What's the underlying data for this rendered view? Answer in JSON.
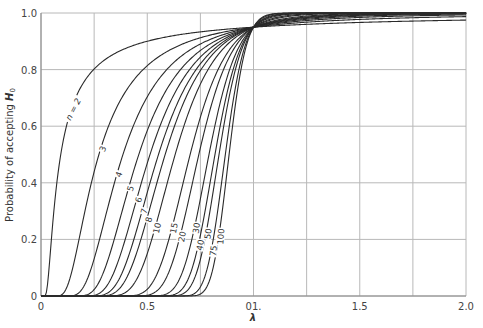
{
  "chart_data": {
    "type": "line",
    "title": "",
    "xlabel": "λ",
    "ylabel": "Probability of accepting H0",
    "xlim": [
      0,
      2.0
    ],
    "ylim": [
      0,
      1.0
    ],
    "grid": true,
    "x_tick_labels": [
      "0",
      "0.5",
      "01.",
      "1.5",
      "2.0"
    ],
    "x_ticks": [
      0,
      0.5,
      1.0,
      1.5,
      2.0
    ],
    "x_gridlines": [
      0,
      0.25,
      0.5,
      0.75,
      1.0,
      1.25,
      1.5,
      1.75,
      2.0
    ],
    "y_tick_labels": [
      "0",
      "0.2",
      "0.4",
      "0.6",
      "0.8",
      "1.0"
    ],
    "y_ticks": [
      0,
      0.2,
      0.4,
      0.6,
      0.8,
      1.0
    ],
    "crossover": {
      "x": 1.0,
      "y": 0.95
    },
    "series_note": "OC curves: P(accept) = P(chi2_{n-1} > c_n / λ^2), c_n = lower 5% chi-square point",
    "series": [
      {
        "name": "n = 2",
        "label": "n = 2",
        "df": 1,
        "c": 0.00393,
        "sample": {
          "0.1": 0.53,
          "0.25": 0.8,
          "0.5": 0.9,
          "1.0": 0.95,
          "2.0": 0.975
        }
      },
      {
        "name": "3",
        "label": "3",
        "df": 2,
        "c": 0.103,
        "sample": {
          "0.25": 0.44,
          "0.5": 0.81,
          "1.0": 0.95,
          "2.0": 0.987
        }
      },
      {
        "name": "4",
        "label": "4",
        "df": 3,
        "c": 0.352,
        "sample": {
          "0.25": 0.13,
          "0.5": 0.65,
          "1.0": 0.95,
          "2.0": 0.99
        }
      },
      {
        "name": "5",
        "label": "5",
        "df": 4,
        "c": 0.711,
        "sample": {
          "0.5": 0.54,
          "1.0": 0.95
        }
      },
      {
        "name": "6",
        "label": "6",
        "df": 5,
        "c": 1.145,
        "sample": {
          "0.5": 0.44,
          "1.0": 0.95
        }
      },
      {
        "name": "7",
        "label": "7",
        "df": 6,
        "c": 1.635,
        "sample": {
          "0.5": 0.37,
          "1.0": 0.95
        }
      },
      {
        "name": "8",
        "label": "8",
        "df": 7,
        "c": 2.167,
        "sample": {
          "0.5": 0.3,
          "1.0": 0.95
        }
      },
      {
        "name": "10",
        "label": "10",
        "df": 9,
        "c": 3.325,
        "sample": {
          "0.5": 0.19,
          "1.0": 0.95
        }
      },
      {
        "name": "15",
        "label": "15",
        "df": 14,
        "c": 6.571,
        "sample": {
          "0.5": 0.06,
          "1.0": 0.95
        }
      },
      {
        "name": "20",
        "label": "20",
        "df": 19,
        "c": 10.117,
        "sample": {
          "0.5": 0.02,
          "1.0": 0.95
        }
      },
      {
        "name": "30",
        "label": "30",
        "df": 29,
        "c": 17.708,
        "sample": {
          "0.75": 0.4,
          "1.0": 0.95
        }
      },
      {
        "name": "40",
        "label": "40",
        "df": 39,
        "c": 25.695,
        "sample": {
          "0.75": 0.3,
          "1.0": 0.95
        }
      },
      {
        "name": "50",
        "label": "50",
        "df": 49,
        "c": 33.93,
        "sample": {
          "0.75": 0.22,
          "1.0": 0.95
        }
      },
      {
        "name": "75",
        "label": "75",
        "df": 74,
        "c": 55.189,
        "sample": {
          "0.75": 0.1,
          "1.0": 0.95
        }
      },
      {
        "name": "100",
        "label": "100",
        "df": 99,
        "c": 77.046,
        "sample": {
          "0.75": 0.04,
          "1.0": 0.95
        }
      }
    ]
  }
}
